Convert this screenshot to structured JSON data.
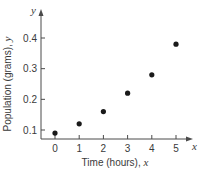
{
  "chart_data": {
    "type": "scatter",
    "title": "",
    "xlabel": "Time (hours), x",
    "ylabel": "Population (grams), y",
    "x_axis_var": "x",
    "y_axis_var": "y",
    "x": [
      0,
      1,
      2,
      3,
      4,
      5
    ],
    "y": [
      0.09,
      0.12,
      0.16,
      0.22,
      0.28,
      0.38
    ],
    "series": [
      {
        "name": "Population",
        "x": [
          0,
          1,
          2,
          3,
          4,
          5
        ],
        "values": [
          0.09,
          0.12,
          0.16,
          0.22,
          0.28,
          0.38
        ]
      }
    ],
    "x_ticks": [
      "0",
      "1",
      "2",
      "3",
      "4",
      "5"
    ],
    "y_ticks": [
      "0.1",
      "0.2",
      "0.3",
      "0.4"
    ],
    "xlim": [
      0,
      5.6
    ],
    "ylim": [
      0.07,
      0.44
    ],
    "grid": false,
    "legend": null,
    "colors": {
      "axis": "#4a4a4a",
      "marker": "#1a1a1a",
      "text": "#3a3a3a"
    }
  },
  "labels": {
    "xlabel_text": "Time (hours), ",
    "xlabel_var": "x",
    "ylabel_text": "Population (grams), ",
    "ylabel_var": "y",
    "x_axis_end": "x",
    "y_axis_end": "y"
  }
}
